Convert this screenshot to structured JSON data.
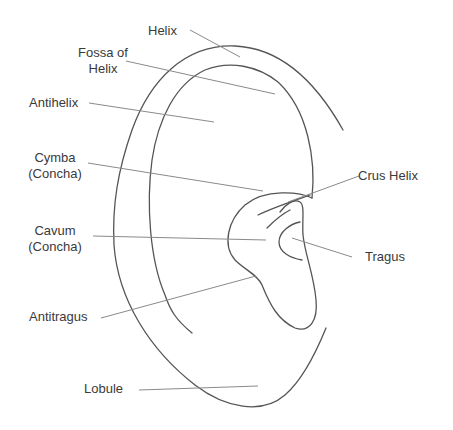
{
  "diagram": {
    "labels": {
      "helix": "Helix",
      "fossa_line1": "Fossa of",
      "fossa_line2": "Helix",
      "antihelix": "Antihelix",
      "cymba_line1": "Cymba",
      "cymba_line2": "(Concha)",
      "cavum_line1": "Cavum",
      "cavum_line2": "(Concha)",
      "crus_helix": "Crus Helix",
      "tragus": "Tragus",
      "antitragus": "Antitragus",
      "lobule": "Lobule"
    },
    "colors": {
      "outline": "#555555",
      "leader": "#8a8a8a",
      "text": "#3a3a3a",
      "background": "#ffffff"
    }
  }
}
